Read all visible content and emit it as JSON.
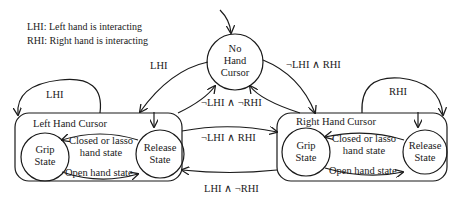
{
  "legend": [
    "LHI: Left hand is interacting",
    "RHI: Right hand is interacting"
  ],
  "states": {
    "no_hand": {
      "line1": "No",
      "line2": "Hand",
      "line3": "Cursor"
    },
    "left_cursor": {
      "title": "Left Hand Cursor",
      "grip": {
        "line1": "Grip",
        "line2": "State"
      },
      "release": {
        "line1": "Release",
        "line2": "State"
      },
      "to_grip_label": {
        "line1": "Closed or lasso",
        "line2": "hand state"
      },
      "to_release_label": "Open hand state"
    },
    "right_cursor": {
      "title": "Right Hand Cursor",
      "grip": {
        "line1": "Grip",
        "line2": "State"
      },
      "release": {
        "line1": "Release",
        "line2": "State"
      },
      "to_grip_label": {
        "line1": "Closed or lasso",
        "line2": "hand state"
      },
      "to_release_label": "Open hand state"
    }
  },
  "transitions": {
    "no_to_left": "LHI",
    "left_self": "LHI",
    "no_to_right": "¬LHI ∧ RHI",
    "right_self": "RHI",
    "left_to_no": "¬LHI ∧ ¬RHI",
    "left_to_right": "¬LHI ∧ RHI",
    "right_to_left": "LHI ∧ ¬RHI"
  }
}
